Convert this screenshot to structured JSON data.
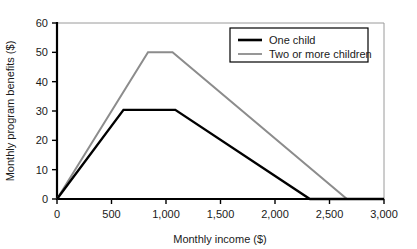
{
  "chart_data": {
    "type": "line",
    "title": "",
    "xlabel": "Monthly income ($)",
    "ylabel": "Monthly program benefits ($)",
    "xlim": [
      0,
      3000
    ],
    "ylim": [
      0,
      60
    ],
    "xticks": [
      0,
      500,
      1000,
      1500,
      2000,
      2500,
      3000
    ],
    "xticklabels": [
      "0",
      "500",
      "1,000",
      "1,500",
      "2,000",
      "2,500",
      "3,000"
    ],
    "yticks": [
      0,
      10,
      20,
      30,
      40,
      50,
      60
    ],
    "yticklabels": [
      "0",
      "10",
      "20",
      "30",
      "40",
      "50",
      "60"
    ],
    "grid": false,
    "legend_position": "upper right",
    "series": [
      {
        "name": "One child",
        "color": "#000000",
        "width": 2.4,
        "points": [
          {
            "x": 0,
            "y": 0
          },
          {
            "x": 610,
            "y": 30.4
          },
          {
            "x": 1085,
            "y": 30.4
          },
          {
            "x": 2320,
            "y": 0
          },
          {
            "x": 3000,
            "y": 0
          }
        ]
      },
      {
        "name": "Two or more children",
        "color": "#8c8c8c",
        "width": 2.0,
        "points": [
          {
            "x": 0,
            "y": 0
          },
          {
            "x": 835,
            "y": 50
          },
          {
            "x": 1060,
            "y": 50
          },
          {
            "x": 2660,
            "y": 0
          },
          {
            "x": 3000,
            "y": 0
          }
        ]
      }
    ]
  },
  "legend": {
    "entries": [
      {
        "label": "One child",
        "color": "#000000"
      },
      {
        "label": "Two or more children",
        "color": "#8c8c8c"
      }
    ]
  },
  "axes": {
    "x_title": "Monthly income ($)",
    "y_title": "Monthly program benefits ($)"
  }
}
